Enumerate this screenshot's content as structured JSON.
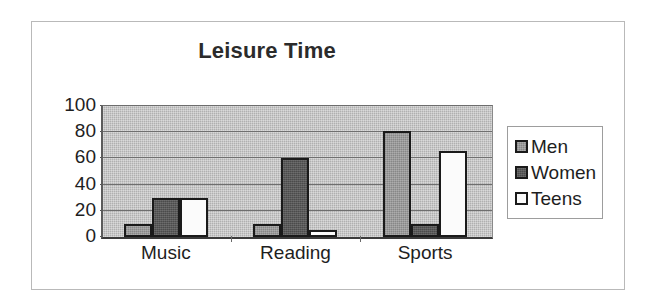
{
  "chart_data": {
    "type": "bar",
    "title": "Leisure Time",
    "xlabel": "",
    "ylabel": "",
    "categories": [
      "Music",
      "Reading",
      "Sports"
    ],
    "series": [
      {
        "name": "Men",
        "values": [
          10,
          10,
          81
        ],
        "color": "#9a9a9a"
      },
      {
        "name": "Women",
        "values": [
          30,
          60,
          10
        ],
        "color": "#4b4b4b"
      },
      {
        "name": "Teens",
        "values": [
          30,
          5,
          66
        ],
        "color": "#fbfbfb"
      }
    ],
    "ylim": [
      0,
      100
    ],
    "yticks": [
      0,
      20,
      40,
      60,
      80,
      100
    ],
    "ytick_labels": [
      "0",
      "20",
      "40",
      "60",
      "80",
      "100"
    ],
    "grid": true,
    "legend_position": "right",
    "plot_background": "#b0b0b0",
    "border_color": "#1a1a1a"
  },
  "legend": {
    "items": [
      {
        "label": "Men"
      },
      {
        "label": "Women"
      },
      {
        "label": "Teens"
      }
    ]
  }
}
